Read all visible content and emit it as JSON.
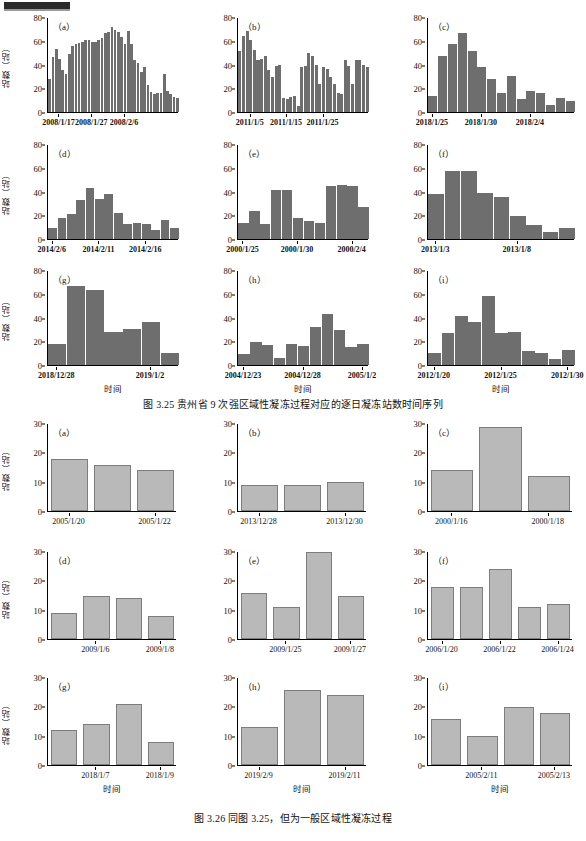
{
  "document": {
    "header_mark": "black-bar",
    "figures": [
      {
        "id": "fig-3-25",
        "caption": "图 3.25    贵州省 9 次强区域性凝冻过程对应的逐日凝冻站数时间序列",
        "y_axis_label": "站数（站）",
        "x_axis_label": "时间",
        "bar_color": "#6e6e6e",
        "panels": [
          {
            "tag": "（a）",
            "ylim": [
              0,
              80
            ],
            "yticks": [
              0,
              20,
              40,
              60,
              80
            ],
            "xticklabels": [
              "2008/1/17",
              "2008/1/27",
              "2008/2/6"
            ],
            "xtickindex": [
              3,
              13,
              23
            ],
            "values": [
              28,
              47,
              54,
              45,
              36,
              32,
              49,
              56,
              58,
              59,
              60,
              61,
              61,
              60,
              60,
              61,
              63,
              67,
              68,
              72,
              70,
              68,
              64,
              58,
              69,
              58,
              44,
              42,
              34,
              38,
              23,
              17,
              15,
              16,
              16,
              32,
              18,
              15,
              13,
              12
            ]
          },
          {
            "tag": "（b）",
            "ylim": [
              0,
              80
            ],
            "yticks": [
              0,
              20,
              40,
              60,
              80
            ],
            "xticklabels": [
              "2011/1/5",
              "2011/1/15",
              "2011/1/25"
            ],
            "xtickindex": [
              3,
              13,
              23
            ],
            "values": [
              52,
              65,
              69,
              61,
              53,
              44,
              45,
              48,
              36,
              30,
              39,
              40,
              12,
              11,
              13,
              14,
              5,
              38,
              39,
              50,
              48,
              40,
              24,
              38,
              37,
              30,
              24,
              16,
              15,
              44,
              39,
              24,
              44,
              44,
              40,
              38
            ]
          },
          {
            "tag": "（c）",
            "ylim": [
              0,
              80
            ],
            "yticks": [
              0,
              20,
              40,
              60,
              80
            ],
            "xticklabels": [
              "2018/1/25",
              "2018/1/30",
              "2018/2/4"
            ],
            "xtickindex": [
              0,
              5,
              10
            ],
            "values": [
              14,
              48,
              58,
              67,
              52,
              38,
              28,
              16,
              31,
              11,
              18,
              16,
              6,
              12,
              9
            ]
          },
          {
            "tag": "（d）",
            "ylim": [
              0,
              80
            ],
            "yticks": [
              0,
              20,
              40,
              60,
              80
            ],
            "xticklabels": [
              "2014/2/6",
              "2014/2/11",
              "2014/2/16"
            ],
            "xtickindex": [
              0,
              5,
              10
            ],
            "values": [
              9,
              18,
              21,
              33,
              43,
              34,
              38,
              22,
              13,
              14,
              13,
              8,
              16,
              9
            ]
          },
          {
            "tag": "（e）",
            "ylim": [
              0,
              80
            ],
            "yticks": [
              0,
              20,
              40,
              60,
              80
            ],
            "xticklabels": [
              "2000/1/25",
              "2000/1/30",
              "2000/2/4"
            ],
            "xtickindex": [
              0,
              5,
              10
            ],
            "values": [
              14,
              24,
              13,
              42,
              42,
              18,
              15,
              14,
              45,
              46,
              45,
              27
            ]
          },
          {
            "tag": "（f）",
            "ylim": [
              0,
              80
            ],
            "yticks": [
              0,
              20,
              40,
              60,
              80
            ],
            "xticklabels": [
              "2013/1/3",
              "2013/1/8"
            ],
            "xtickindex": [
              0,
              5
            ],
            "values": [
              38,
              58,
              58,
              39,
              36,
              20,
              12,
              6,
              9
            ]
          },
          {
            "tag": "（g）",
            "ylim": [
              0,
              80
            ],
            "yticks": [
              0,
              20,
              40,
              60,
              80
            ],
            "xticklabels": [
              "2018/12/28",
              "2019/1/2"
            ],
            "xtickindex": [
              0,
              5
            ],
            "values": [
              18,
              67,
              64,
              28,
              31,
              37,
              10
            ]
          },
          {
            "tag": "（h）",
            "ylim": [
              0,
              80
            ],
            "yticks": [
              0,
              20,
              40,
              60,
              80
            ],
            "xticklabels": [
              "2004/12/23",
              "2004/12/28",
              "2005/1/2"
            ],
            "xtickindex": [
              0,
              5,
              10
            ],
            "values": [
              9,
              20,
              17,
              6,
              18,
              16,
              32,
              43,
              30,
              15,
              18
            ]
          },
          {
            "tag": "（i）",
            "ylim": [
              0,
              80
            ],
            "yticks": [
              0,
              20,
              40,
              60,
              80
            ],
            "xticklabels": [
              "2012/1/20",
              "2012/1/25",
              "2012/1/30"
            ],
            "xtickindex": [
              0,
              5,
              10
            ],
            "values": [
              10,
              27,
              42,
              37,
              59,
              27,
              28,
              12,
              10,
              5,
              13
            ]
          }
        ]
      },
      {
        "id": "fig-3-26",
        "caption": "图 3.26    同图 3.25，但为一般区域性凝冻过程",
        "y_axis_label": "站数（站）",
        "x_axis_label": "时间",
        "bar_color": "#b9b9b9",
        "panels": [
          {
            "tag": "（a）",
            "ylim": [
              0,
              30
            ],
            "yticks": [
              0,
              10,
              20,
              30
            ],
            "xticklabels": [
              "2005/1/20",
              "2005/1/22"
            ],
            "xtickindex": [
              0,
              2
            ],
            "values": [
              18,
              16,
              14
            ]
          },
          {
            "tag": "（b）",
            "ylim": [
              0,
              30
            ],
            "yticks": [
              0,
              10,
              20,
              30
            ],
            "xticklabels": [
              "2013/12/28",
              "2013/12/30"
            ],
            "xtickindex": [
              0,
              2
            ],
            "values": [
              9,
              9,
              10
            ]
          },
          {
            "tag": "（c）",
            "ylim": [
              0,
              30
            ],
            "yticks": [
              0,
              10,
              20,
              30
            ],
            "xticklabels": [
              "2000/1/16",
              "2000/1/18"
            ],
            "xtickindex": [
              0,
              2
            ],
            "values": [
              14,
              29,
              12
            ]
          },
          {
            "tag": "（d）",
            "ylim": [
              0,
              30
            ],
            "yticks": [
              0,
              10,
              20,
              30
            ],
            "xticklabels": [
              "2009/1/6",
              "2009/1/8"
            ],
            "xtickindex": [
              1,
              3
            ],
            "values": [
              9,
              15,
              14,
              8
            ]
          },
          {
            "tag": "（e）",
            "ylim": [
              0,
              30
            ],
            "yticks": [
              0,
              10,
              20,
              30
            ],
            "xticklabels": [
              "2009/1/25",
              "2009/1/27"
            ],
            "xtickindex": [
              1,
              3
            ],
            "values": [
              16,
              11,
              30,
              15
            ]
          },
          {
            "tag": "（f）",
            "ylim": [
              0,
              30
            ],
            "yticks": [
              0,
              10,
              20,
              30
            ],
            "xticklabels": [
              "2006/1/20",
              "2006/1/22",
              "2006/1/24"
            ],
            "xtickindex": [
              0,
              2,
              4
            ],
            "values": [
              18,
              18,
              24,
              11,
              12
            ]
          },
          {
            "tag": "（g）",
            "ylim": [
              0,
              30
            ],
            "yticks": [
              0,
              10,
              20,
              30
            ],
            "xticklabels": [
              "2018/1/7",
              "2018/1/9"
            ],
            "xtickindex": [
              1,
              3
            ],
            "values": [
              12,
              14,
              21,
              8
            ]
          },
          {
            "tag": "（h）",
            "ylim": [
              0,
              30
            ],
            "yticks": [
              0,
              10,
              20,
              30
            ],
            "xticklabels": [
              "2019/2/9",
              "2019/2/11"
            ],
            "xtickindex": [
              0,
              2
            ],
            "values": [
              13,
              26,
              24
            ]
          },
          {
            "tag": "（i）",
            "ylim": [
              0,
              30
            ],
            "yticks": [
              0,
              10,
              20,
              30
            ],
            "xticklabels": [
              "2005/2/11",
              "2005/2/13"
            ],
            "xtickindex": [
              1,
              3
            ],
            "values": [
              16,
              10,
              20,
              18
            ]
          }
        ]
      }
    ]
  },
  "chart_data": [
    {
      "type": "bar",
      "title": "图 3.25 贵州省 9 次强区域性凝冻过程对应的逐日凝冻站数时间序列",
      "xlabel": "时间",
      "ylabel": "站数（站）",
      "ylim": [
        0,
        80
      ],
      "grid": false,
      "legend": "none",
      "subplots": [
        {
          "panel": "(a)",
          "x_ticks": [
            "2008/1/17",
            "2008/1/27",
            "2008/2/6"
          ],
          "values": [
            28,
            47,
            54,
            45,
            36,
            32,
            49,
            56,
            58,
            59,
            60,
            61,
            61,
            60,
            60,
            61,
            63,
            67,
            68,
            72,
            70,
            68,
            64,
            58,
            69,
            58,
            44,
            42,
            34,
            38,
            23,
            17,
            15,
            16,
            16,
            32,
            18,
            15,
            13,
            12
          ]
        },
        {
          "panel": "(b)",
          "x_ticks": [
            "2011/1/5",
            "2011/1/15",
            "2011/1/25"
          ],
          "values": [
            52,
            65,
            69,
            61,
            53,
            44,
            45,
            48,
            36,
            30,
            39,
            40,
            12,
            11,
            13,
            14,
            5,
            38,
            39,
            50,
            48,
            40,
            24,
            38,
            37,
            30,
            24,
            16,
            15,
            44,
            39,
            24,
            44,
            44,
            40,
            38
          ]
        },
        {
          "panel": "(c)",
          "x_ticks": [
            "2018/1/25",
            "2018/1/30",
            "2018/2/4"
          ],
          "values": [
            14,
            48,
            58,
            67,
            52,
            38,
            28,
            16,
            31,
            11,
            18,
            16,
            6,
            12,
            9
          ]
        },
        {
          "panel": "(d)",
          "x_ticks": [
            "2014/2/6",
            "2014/2/11",
            "2014/2/16"
          ],
          "values": [
            9,
            18,
            21,
            33,
            43,
            34,
            38,
            22,
            13,
            14,
            13,
            8,
            16,
            9
          ]
        },
        {
          "panel": "(e)",
          "x_ticks": [
            "2000/1/25",
            "2000/1/30",
            "2000/2/4"
          ],
          "values": [
            14,
            24,
            13,
            42,
            42,
            18,
            15,
            14,
            45,
            46,
            45,
            27
          ]
        },
        {
          "panel": "(f)",
          "x_ticks": [
            "2013/1/3",
            "2013/1/8"
          ],
          "values": [
            38,
            58,
            58,
            39,
            36,
            20,
            12,
            6,
            9
          ]
        },
        {
          "panel": "(g)",
          "x_ticks": [
            "2018/12/28",
            "2019/1/2"
          ],
          "values": [
            18,
            67,
            64,
            28,
            31,
            37,
            10
          ]
        },
        {
          "panel": "(h)",
          "x_ticks": [
            "2004/12/23",
            "2004/12/28",
            "2005/1/2"
          ],
          "values": [
            9,
            20,
            17,
            6,
            18,
            16,
            32,
            43,
            30,
            15,
            18
          ]
        },
        {
          "panel": "(i)",
          "x_ticks": [
            "2012/1/20",
            "2012/1/25",
            "2012/1/30"
          ],
          "values": [
            10,
            27,
            42,
            37,
            59,
            27,
            28,
            12,
            10,
            5,
            13
          ]
        }
      ]
    },
    {
      "type": "bar",
      "title": "图 3.26 同图 3.25，但为一般区域性凝冻过程",
      "xlabel": "时间",
      "ylabel": "站数（站）",
      "ylim": [
        0,
        30
      ],
      "grid": false,
      "legend": "none",
      "subplots": [
        {
          "panel": "(a)",
          "x_ticks": [
            "2005/1/20",
            "2005/1/22"
          ],
          "values": [
            18,
            16,
            14
          ]
        },
        {
          "panel": "(b)",
          "x_ticks": [
            "2013/12/28",
            "2013/12/30"
          ],
          "values": [
            9,
            9,
            10
          ]
        },
        {
          "panel": "(c)",
          "x_ticks": [
            "2000/1/16",
            "2000/1/18"
          ],
          "values": [
            14,
            29,
            12
          ]
        },
        {
          "panel": "(d)",
          "x_ticks": [
            "2009/1/6",
            "2009/1/8"
          ],
          "values": [
            9,
            15,
            14,
            8
          ]
        },
        {
          "panel": "(e)",
          "x_ticks": [
            "2009/1/25",
            "2009/1/27"
          ],
          "values": [
            16,
            11,
            30,
            15
          ]
        },
        {
          "panel": "(f)",
          "x_ticks": [
            "2006/1/20",
            "2006/1/22",
            "2006/1/24"
          ],
          "values": [
            18,
            18,
            24,
            11,
            12
          ]
        },
        {
          "panel": "(g)",
          "x_ticks": [
            "2018/1/7",
            "2018/1/9"
          ],
          "values": [
            12,
            14,
            21,
            8
          ]
        },
        {
          "panel": "(h)",
          "x_ticks": [
            "2019/2/9",
            "2019/2/11"
          ],
          "values": [
            13,
            26,
            24
          ]
        },
        {
          "panel": "(i)",
          "x_ticks": [
            "2005/2/11",
            "2005/2/13"
          ],
          "values": [
            16,
            10,
            20,
            18
          ]
        }
      ]
    }
  ]
}
